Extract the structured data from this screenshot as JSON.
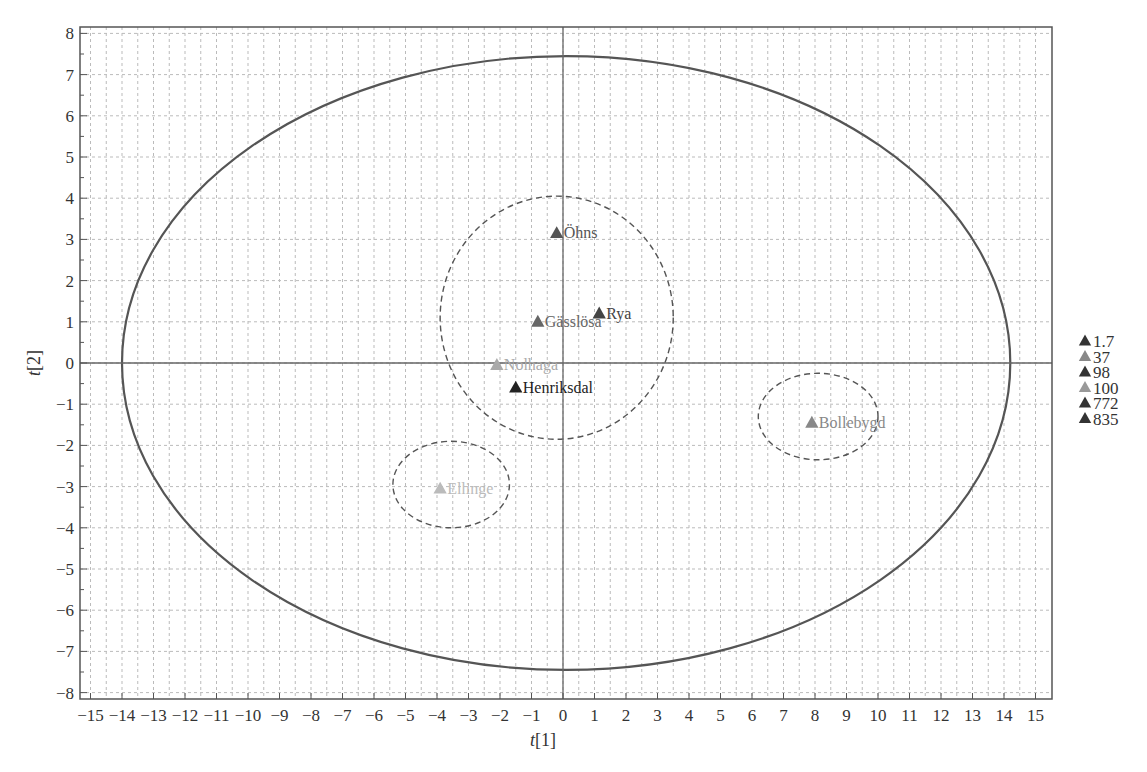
{
  "chart_data": {
    "type": "scatter",
    "title": "",
    "xlabel": "t[1]",
    "ylabel": "t[2]",
    "xlim": [
      -15.5,
      15.5
    ],
    "ylim": [
      -8.2,
      8.2
    ],
    "grid": true,
    "x_ticks": [
      -15,
      -14,
      -13,
      -12,
      -11,
      -10,
      -9,
      -8,
      -7,
      -6,
      -5,
      -4,
      -3,
      -2,
      -1,
      0,
      1,
      2,
      3,
      4,
      5,
      6,
      7,
      8,
      9,
      10,
      11,
      12,
      13,
      14,
      15
    ],
    "y_ticks": [
      -8,
      -7,
      -6,
      -5,
      -4,
      -3,
      -2,
      -1,
      0,
      1,
      2,
      3,
      4,
      5,
      6,
      7,
      8
    ],
    "points": [
      {
        "label": "Öhns",
        "x": -0.2,
        "y": 3.15,
        "group": "98",
        "color": "#555555"
      },
      {
        "label": "Rya",
        "x": 1.15,
        "y": 1.2,
        "group": "772",
        "color": "#444444"
      },
      {
        "label": "Gässlösa",
        "x": -0.8,
        "y": 1.0,
        "group": "37",
        "color": "#666666"
      },
      {
        "label": "Nolhaga",
        "x": -2.1,
        "y": -0.05,
        "group": "100",
        "color": "#aaaaaa"
      },
      {
        "label": "Henriksdal",
        "x": -1.5,
        "y": -0.6,
        "group": "835",
        "color": "#222222"
      },
      {
        "label": "Ellinge",
        "x": -3.9,
        "y": -3.05,
        "group": "1.7",
        "color": "#bbbbbb"
      },
      {
        "label": "Bollebygd",
        "x": 7.9,
        "y": -1.45,
        "group": "100",
        "color": "#888888"
      }
    ],
    "ellipses": [
      {
        "name": "hotelling-t2",
        "cx": 0.1,
        "cy": 0.0,
        "rx": 14.1,
        "ry": 7.45,
        "style": "solid"
      },
      {
        "name": "cluster-center",
        "cx": -0.2,
        "cy": 1.1,
        "rx": 3.7,
        "ry": 2.95,
        "style": "dashed"
      },
      {
        "name": "cluster-ellinge",
        "cx": -3.55,
        "cy": -2.95,
        "rx": 1.85,
        "ry": 1.05,
        "style": "dashed"
      },
      {
        "name": "cluster-bollebygd",
        "cx": 8.1,
        "cy": -1.3,
        "rx": 1.9,
        "ry": 1.05,
        "style": "dashed"
      }
    ],
    "legend": {
      "position": "right",
      "entries": [
        {
          "label": "1.7",
          "color": "#333333"
        },
        {
          "label": "37",
          "color": "#888888"
        },
        {
          "label": "98",
          "color": "#333333"
        },
        {
          "label": "100",
          "color": "#999999"
        },
        {
          "label": "772",
          "color": "#333333"
        },
        {
          "label": "835",
          "color": "#333333"
        }
      ]
    }
  }
}
